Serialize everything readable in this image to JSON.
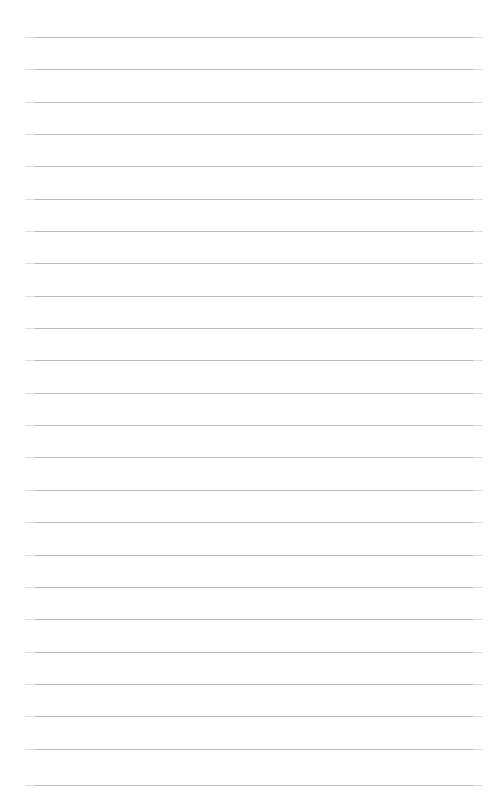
{
  "document": {
    "kind": "lined-paper-sheet",
    "title": "",
    "body_text": "",
    "is_blank": true,
    "page_number": "",
    "header_text": "",
    "footer_text": ""
  },
  "sheet": {
    "width_px": 495,
    "height_px": 812,
    "background_color": "#ffffff",
    "paper_tint": "#ffffff"
  },
  "ruling": {
    "style": "horizontal-ruled",
    "line_color": "#b9b9b9",
    "line_thickness_px": 1,
    "line_count": 24,
    "first_line_y_px": 37,
    "line_spacing_px": 32.4,
    "left_margin_px": 25,
    "right_edge_px": 483,
    "margin_rule_visible": false,
    "line_y_positions": [
      37,
      69,
      102,
      134,
      166,
      199,
      231,
      263,
      296,
      328,
      360,
      393,
      425,
      457,
      490,
      522,
      555,
      587,
      619,
      652,
      684,
      716,
      749,
      785
    ]
  },
  "content": {
    "writing_present": false,
    "lines": []
  }
}
